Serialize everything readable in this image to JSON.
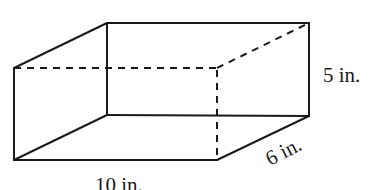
{
  "figure": {
    "type": "rectangular-prism",
    "labels": {
      "length": "10 in.",
      "width": "6 in.",
      "height": "5 in."
    },
    "colors": {
      "line": "#1a1a1a",
      "background": "#ffffff"
    }
  }
}
